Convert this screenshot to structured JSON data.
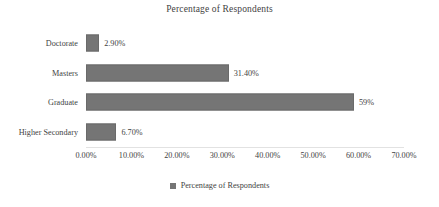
{
  "chart_data": {
    "type": "bar",
    "orientation": "horizontal",
    "title": "Percentage of Respondents",
    "xlabel": "",
    "ylabel": "",
    "categories": [
      "Doctorate",
      "Masters",
      "Graduate",
      "Higher Secondary"
    ],
    "values": [
      2.9,
      31.4,
      59,
      6.7
    ],
    "data_labels": [
      "2.90%",
      "31.40%",
      "59%",
      "6.70%"
    ],
    "xlim": [
      0,
      70
    ],
    "xtick_values": [
      0,
      10,
      20,
      30,
      40,
      50,
      60,
      70
    ],
    "xtick_labels": [
      "0.00%",
      "10.00%",
      "20.00%",
      "30.00%",
      "40.00%",
      "50.00%",
      "60.00%",
      "70.00%"
    ],
    "grid": false,
    "legend": {
      "position": "bottom",
      "entries": [
        "Percentage of Respondents"
      ],
      "marker": "square-swatch"
    },
    "series": [
      {
        "name": "Percentage of Respondents",
        "color": "#757575",
        "values": [
          2.9,
          31.4,
          59,
          6.7
        ]
      }
    ],
    "colors": {
      "bar": "#757575",
      "bar_outline": "#6a6a6a",
      "text": "#3f3f3f",
      "axis_line": "#e2e2e2",
      "background": "#ffffff"
    }
  }
}
